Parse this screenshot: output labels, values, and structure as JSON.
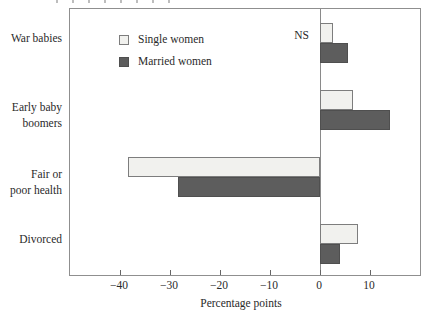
{
  "chart_data": {
    "type": "bar",
    "orientation": "horizontal",
    "categories": [
      "War babies",
      "Early baby boomers",
      "Fair or poor health",
      "Divorced"
    ],
    "categories_display": [
      [
        "War babies"
      ],
      [
        "Early baby",
        "boomers"
      ],
      [
        "Fair or",
        "poor health"
      ],
      [
        "Divorced"
      ]
    ],
    "series": [
      {
        "name": "Single women",
        "values": [
          2.5,
          6.5,
          -38.5,
          7.5
        ],
        "fill": "#f1f1ee",
        "border": "#7d7d7d"
      },
      {
        "name": "Married women",
        "values": [
          5.5,
          14.0,
          -28.5,
          4.0
        ],
        "fill": "#5d5d5d",
        "border": "#4f4f4f"
      }
    ],
    "xlabel": "Percentage points",
    "xlim": [
      -50,
      20
    ],
    "xticks": [
      -40,
      -30,
      -20,
      -10,
      0,
      10
    ],
    "xtick_labels": [
      "−40",
      "−30",
      "−20",
      "−10",
      "0",
      "10"
    ],
    "annotations": [
      {
        "text": "NS",
        "category": "War babies",
        "series": "Single women",
        "position": "left-of-bar"
      }
    ],
    "legend_position": "upper-left-inside",
    "grid": false,
    "zero_line": true
  }
}
